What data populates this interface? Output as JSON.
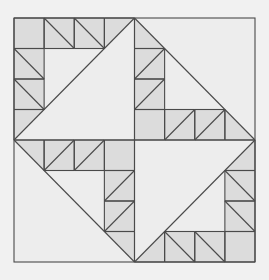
{
  "diagram": {
    "grid_size": 8,
    "colors": {
      "background": "#f1f1f1",
      "light_fill": "#ededed",
      "shaded_fill": "#dcdcdc",
      "line": "#4a4a4a"
    },
    "big_diagonals": [
      {
        "quadrant": "top-left",
        "from": [
          4,
          0
        ],
        "to": [
          0,
          4
        ]
      },
      {
        "quadrant": "top-right",
        "from": [
          4,
          0
        ],
        "to": [
          8,
          4
        ]
      },
      {
        "quadrant": "bottom-left",
        "from": [
          0,
          4
        ],
        "to": [
          4,
          8
        ]
      },
      {
        "quadrant": "bottom-right",
        "from": [
          8,
          4
        ],
        "to": [
          4,
          8
        ]
      }
    ],
    "cells": [
      {
        "c": 0,
        "r": 0,
        "type": "plain"
      },
      {
        "c": 1,
        "r": 0,
        "type": "back"
      },
      {
        "c": 2,
        "r": 0,
        "type": "back"
      },
      {
        "c": 3,
        "r": 0,
        "type": "half-ul"
      },
      {
        "c": 0,
        "r": 1,
        "type": "back"
      },
      {
        "c": 0,
        "r": 2,
        "type": "back"
      },
      {
        "c": 0,
        "r": 3,
        "type": "half-ul"
      },
      {
        "c": 4,
        "r": 0,
        "type": "half-ll"
      },
      {
        "c": 4,
        "r": 1,
        "type": "fwd"
      },
      {
        "c": 4,
        "r": 2,
        "type": "fwd"
      },
      {
        "c": 4,
        "r": 3,
        "type": "plain"
      },
      {
        "c": 5,
        "r": 3,
        "type": "fwd"
      },
      {
        "c": 6,
        "r": 3,
        "type": "fwd"
      },
      {
        "c": 7,
        "r": 3,
        "type": "half-ll"
      },
      {
        "c": 0,
        "r": 4,
        "type": "half-ur"
      },
      {
        "c": 1,
        "r": 4,
        "type": "fwd"
      },
      {
        "c": 2,
        "r": 4,
        "type": "fwd"
      },
      {
        "c": 3,
        "r": 4,
        "type": "plain"
      },
      {
        "c": 3,
        "r": 5,
        "type": "fwd"
      },
      {
        "c": 3,
        "r": 6,
        "type": "fwd"
      },
      {
        "c": 3,
        "r": 7,
        "type": "half-ur"
      },
      {
        "c": 7,
        "r": 4,
        "type": "half-lr"
      },
      {
        "c": 7,
        "r": 5,
        "type": "back"
      },
      {
        "c": 7,
        "r": 6,
        "type": "back"
      },
      {
        "c": 7,
        "r": 7,
        "type": "plain"
      },
      {
        "c": 4,
        "r": 7,
        "type": "half-lr"
      },
      {
        "c": 5,
        "r": 7,
        "type": "back"
      },
      {
        "c": 6,
        "r": 7,
        "type": "back"
      }
    ]
  }
}
